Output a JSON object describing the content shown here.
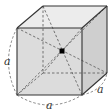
{
  "diagram": {
    "labels": {
      "left_edge": "a",
      "bottom_edge": "a",
      "depth_edge": "a"
    },
    "colors": {
      "front_face": "#dcdcdc",
      "top_face": "#ececec",
      "right_face": "#cfcfcf",
      "edge": "#333333",
      "dashed": "#555555",
      "centre_point": "#000000"
    },
    "vertices": {
      "front_top_left": [
        17,
        28
      ],
      "front_top_right": [
        82,
        28
      ],
      "front_bottom_left": [
        17,
        95
      ],
      "front_bottom_right": [
        82,
        95
      ],
      "back_top_left": [
        43,
        6
      ],
      "back_top_right": [
        107,
        6
      ],
      "back_bottom_left": [
        43,
        73
      ],
      "back_bottom_right": [
        107,
        73
      ],
      "centre": [
        62,
        51
      ]
    }
  }
}
